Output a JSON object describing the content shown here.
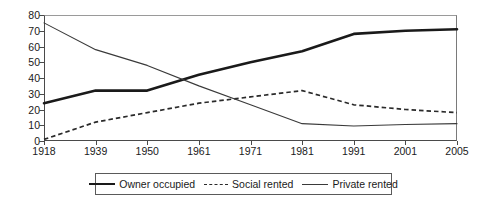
{
  "chart_data": {
    "type": "line",
    "title": "",
    "subtitle": "",
    "xlabel": "",
    "ylabel": "",
    "categories": [
      "1918",
      "1939",
      "1950",
      "1961",
      "1971",
      "1981",
      "1991",
      "2001",
      "2005"
    ],
    "ylim": [
      0,
      80
    ],
    "ytick_step": 10,
    "yticks": [
      "80",
      "70",
      "60",
      "50",
      "40",
      "30",
      "20",
      "10",
      "0"
    ],
    "grid": false,
    "legend_position": "bottom-center",
    "series": [
      {
        "name": "Owner occupied",
        "style": "thick-solid",
        "color": "#1a1a1a",
        "values": [
          24,
          32,
          32,
          42,
          50,
          57,
          68,
          70,
          71
        ]
      },
      {
        "name": "Social rented",
        "style": "dashed",
        "color": "#2a2a2a",
        "values": [
          1,
          12,
          18,
          24,
          28,
          32,
          23,
          20,
          18
        ]
      },
      {
        "name": "Private rented",
        "style": "thin-solid",
        "color": "#3a3a3a",
        "values": [
          75,
          58,
          48,
          35,
          23,
          11,
          9.5,
          10.5,
          11
        ]
      }
    ]
  },
  "legend": {
    "items": [
      {
        "label": "Owner occupied",
        "swatch": "thick-solid-line-icon"
      },
      {
        "label": "Social rented",
        "swatch": "dashed-line-icon"
      },
      {
        "label": "Private rented",
        "swatch": "thin-solid-line-icon"
      }
    ]
  }
}
